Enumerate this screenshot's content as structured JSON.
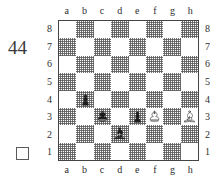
{
  "diagram": {
    "puzzle_number": "44",
    "side_to_move_indicator": "white-empty-square",
    "side_to_move": "white",
    "board": {
      "orientation": "white-bottom",
      "file_labels": [
        "a",
        "b",
        "c",
        "d",
        "e",
        "f",
        "g",
        "h"
      ],
      "rank_labels": [
        "8",
        "7",
        "6",
        "5",
        "4",
        "3",
        "2",
        "1"
      ],
      "light_square_color": "#ffffff",
      "dark_square_color": "#8c8c8c",
      "border_color": "#444444",
      "pieces": [
        {
          "square": "b4",
          "piece": "pawn",
          "color": "black",
          "glyph": "black-pawn-icon"
        },
        {
          "square": "c3",
          "piece": "king",
          "color": "black",
          "glyph": "black-king-icon"
        },
        {
          "square": "d2",
          "piece": "bishop",
          "color": "black",
          "glyph": "black-bishop-icon"
        },
        {
          "square": "e3",
          "piece": "pawn",
          "color": "black",
          "glyph": "black-pawn-icon"
        },
        {
          "square": "f3",
          "piece": "king",
          "color": "white",
          "glyph": "white-king-icon"
        },
        {
          "square": "h3",
          "piece": "bishop",
          "color": "white",
          "glyph": "white-bishop-icon"
        }
      ]
    }
  }
}
